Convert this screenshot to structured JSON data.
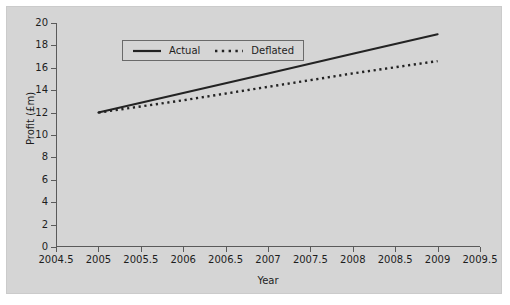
{
  "chart_data": {
    "type": "line",
    "title": "",
    "xlabel": "Year",
    "ylabel": "Profit (£m)",
    "xlim": [
      2004.5,
      2009.5
    ],
    "ylim": [
      0,
      20
    ],
    "grid": false,
    "legend_position": "top-left",
    "x_ticks": [
      "2004.5",
      "2005",
      "2005.5",
      "2006",
      "2006.5",
      "2007",
      "2007.5",
      "2008",
      "2008.5",
      "2009",
      "2009.5"
    ],
    "x_tick_values": [
      2004.5,
      2005,
      2005.5,
      2006,
      2006.5,
      2007,
      2007.5,
      2008,
      2008.5,
      2009,
      2009.5
    ],
    "y_ticks": [
      "0",
      "2",
      "4",
      "6",
      "8",
      "10",
      "12",
      "14",
      "16",
      "18",
      "20"
    ],
    "y_tick_values": [
      0,
      2,
      4,
      6,
      8,
      10,
      12,
      14,
      16,
      18,
      20
    ],
    "x": [
      2005,
      2006,
      2007,
      2008,
      2009
    ],
    "series": [
      {
        "name": "Actual",
        "style": "solid",
        "color": "#232323",
        "values": [
          12.0,
          13.75,
          15.5,
          17.25,
          19.0
        ]
      },
      {
        "name": "Deflated",
        "style": "dotted",
        "color": "#232323",
        "values": [
          12.0,
          13.1,
          14.3,
          15.5,
          16.6
        ]
      }
    ]
  },
  "figure": {
    "background_color": "#d5d5d5",
    "page_color": "#ffffff",
    "axis_color": "#5a5a5a",
    "text_color": "#1d1d1d"
  }
}
